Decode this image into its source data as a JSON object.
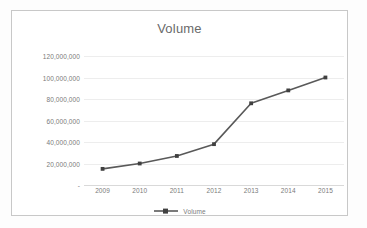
{
  "chart_data": {
    "type": "line",
    "title": "Volume",
    "xlabel": "",
    "ylabel": "",
    "categories": [
      "2009",
      "2010",
      "2011",
      "2012",
      "2013",
      "2014",
      "2015"
    ],
    "series": [
      {
        "name": "Volume",
        "values": [
          15000000,
          20000000,
          27000000,
          38000000,
          76000000,
          88000000,
          100000000
        ]
      }
    ],
    "ylim": [
      0,
      120000000
    ],
    "ytick_values": [
      0,
      20000000,
      40000000,
      60000000,
      80000000,
      100000000,
      120000000
    ],
    "ytick_labels": [
      "-",
      "20,000,000",
      "40,000,000",
      "60,000,000",
      "80,000,000",
      "100,000,000",
      "120,000,000"
    ],
    "grid": true,
    "legend_position": "bottom",
    "legend_entries": [
      "Volume"
    ],
    "markers": true,
    "colors": {
      "series_line": "#595959",
      "gridline": "#ededed",
      "axis_line": "#d9d9d9",
      "text": "#7a7a7a",
      "title_text": "#6a6a6a",
      "chart_border": "#c8c8c8",
      "plot_background": "#ffffff"
    }
  },
  "legend": {
    "swatch_icon": "line-marker-icon"
  }
}
